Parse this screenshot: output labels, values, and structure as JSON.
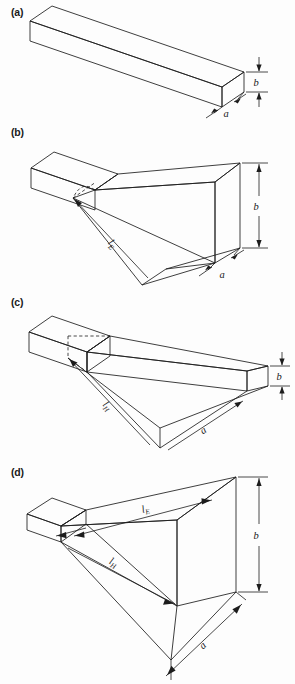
{
  "figure": {
    "background_color": "#fdfdfd",
    "line_color": "#1c1c1c"
  },
  "panels": [
    {
      "key": "a",
      "label": "(a)",
      "name": "rectangular-waveguide",
      "dimensions": [
        {
          "symbol": "b",
          "sub": "",
          "name": "height-dimension"
        },
        {
          "symbol": "a",
          "sub": "",
          "name": "width-dimension"
        }
      ]
    },
    {
      "key": "b",
      "label": "(b)",
      "name": "e-plane-sectoral-horn",
      "dimensions": [
        {
          "symbol": "b",
          "sub": "",
          "name": "aperture-height-dimension"
        },
        {
          "symbol": "a",
          "sub": "",
          "name": "aperture-width-dimension"
        },
        {
          "symbol": "l",
          "sub": "E",
          "name": "e-plane-slant-length"
        }
      ]
    },
    {
      "key": "c",
      "label": "(c)",
      "name": "h-plane-sectoral-horn",
      "dimensions": [
        {
          "symbol": "b",
          "sub": "",
          "name": "aperture-height-dimension"
        },
        {
          "symbol": "a",
          "sub": "",
          "name": "aperture-width-dimension"
        },
        {
          "symbol": "l",
          "sub": "H",
          "name": "h-plane-slant-length"
        }
      ]
    },
    {
      "key": "d",
      "label": "(d)",
      "name": "pyramidal-horn",
      "dimensions": [
        {
          "symbol": "b",
          "sub": "",
          "name": "aperture-height-dimension"
        },
        {
          "symbol": "a",
          "sub": "",
          "name": "aperture-width-dimension"
        },
        {
          "symbol": "l",
          "sub": "E",
          "name": "e-plane-slant-length"
        },
        {
          "symbol": "l",
          "sub": "H",
          "name": "h-plane-slant-length"
        }
      ]
    }
  ],
  "labels": {
    "a": "a",
    "b": "b",
    "l": "l",
    "sub_E": "E",
    "sub_H": "H"
  }
}
